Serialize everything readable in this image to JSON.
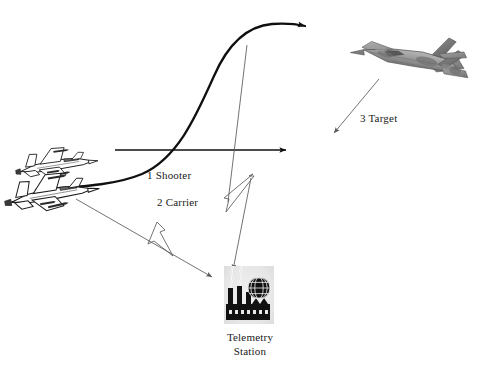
{
  "figure": {
    "title": "",
    "background_color": "#ffffff"
  },
  "labels": {
    "shooter": "1 Shooter",
    "carrier": "2 Carrier",
    "target": "3 Target",
    "telemetry_line1": "Telemetry",
    "telemetry_line2": "Station"
  },
  "entities": [
    {
      "id": "shooter-aircraft",
      "name": "shooter-aircraft",
      "label": "1 Shooter",
      "kind": "fighter-jet-line-art",
      "heading": "right",
      "x": 55,
      "y": 163
    },
    {
      "id": "carrier-aircraft",
      "name": "carrier-aircraft",
      "label": "2 Carrier",
      "kind": "fighter-jet-line-art",
      "heading": "right",
      "x": 48,
      "y": 190
    },
    {
      "id": "target-aircraft",
      "name": "target-aircraft",
      "label": "3 Target",
      "kind": "stealth-fighter-grayscale",
      "heading": "left-down",
      "x": 412,
      "y": 52
    },
    {
      "id": "telemetry-station",
      "name": "telemetry-station",
      "label": "Telemetry Station",
      "kind": "factory-with-globe-icon",
      "x": 248,
      "y": 298
    }
  ],
  "connectors": [
    {
      "id": "missile-trajectory",
      "name": "missile-trajectory-curve",
      "from": "carrier-aircraft",
      "to": "upper-right",
      "style": "thick-s-curve-with-arrowhead",
      "color": "#101010",
      "width": 2.2
    },
    {
      "id": "horizontal-axis",
      "name": "horizontal-reference-arrow",
      "from": "shooter-aircraft",
      "to": "right",
      "style": "straight-arrow",
      "color": "#101010",
      "width": 1.3,
      "x1": 115,
      "y1": 150,
      "x2": 292,
      "y2": 150
    },
    {
      "id": "target-pointer",
      "name": "target-pointer-arrow",
      "from": "target-aircraft",
      "to": "down-left",
      "style": "thin-arrow",
      "color": "#5a5a5a",
      "width": 0.9,
      "x1": 378,
      "y1": 80,
      "x2": 331,
      "y2": 137
    },
    {
      "id": "datalink-carrier-to-station",
      "name": "datalink-carrier-to-telemetry-arrow",
      "from": "carrier-aircraft",
      "to": "telemetry-station",
      "style": "thin-arrow-with-lightning",
      "color": "#4a4a4a",
      "width": 0.9,
      "x1": 78,
      "y1": 200,
      "x2": 215,
      "y2": 280
    },
    {
      "id": "datalink-missile-to-station",
      "name": "datalink-missile-to-telemetry-arrow",
      "from": "missile-trajectory",
      "to": "telemetry-station",
      "style": "thin-arrow-with-lightning",
      "color": "#4a4a4a",
      "width": 0.9,
      "x1": 246,
      "y1": 46,
      "x2": 233,
      "y2": 275
    }
  ],
  "signal_symbols": [
    {
      "id": "lightning-left",
      "name": "lightning-bolt-left",
      "x": 158,
      "y": 228
    },
    {
      "id": "lightning-right",
      "name": "lightning-bolt-right",
      "x": 238,
      "y": 190
    }
  ],
  "colors": {
    "ink": "#101010",
    "thin_line": "#4a4a4a",
    "gray_line": "#5a5a5a",
    "icon_panel": "#e8e8e8",
    "icon_dark": "#111111",
    "jet_body_light": "#b9b9b9",
    "jet_body_mid": "#8e8e8e",
    "jet_body_dark": "#6a6a6a",
    "background": "#ffffff"
  }
}
